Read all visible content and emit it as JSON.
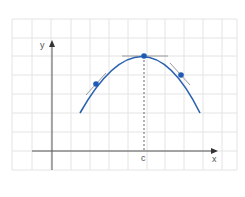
{
  "diagram": {
    "axes": {
      "x_label": "x",
      "y_label": "y"
    },
    "marked_point_label": "c",
    "colors": {
      "curve": "#2b62b0",
      "grid": "#e4e4e4",
      "axis": "#555555",
      "tangent": "#9a9a9a",
      "point": "#1f5bb5"
    },
    "curve": {
      "shape": "downward parabola",
      "vertex_at": "c"
    },
    "points": [
      {
        "name": "left-point",
        "tangent": "positive slope"
      },
      {
        "name": "vertex",
        "tangent": "horizontal"
      },
      {
        "name": "right-point",
        "tangent": "negative slope"
      }
    ]
  }
}
